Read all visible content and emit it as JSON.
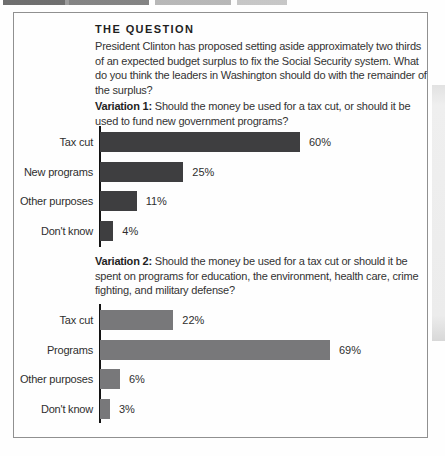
{
  "figure": {
    "question_header": "THE QUESTION",
    "question_text": "President Clinton has proposed setting aside approximately two thirds of an expected budget surplus to fix the Social Security system. What do you think the leaders in Washington should do with the remainder of the surplus?",
    "variation1": {
      "label": "Variation 1:",
      "text": "Should the money be used for a tax cut, or should it be used to fund new government programs?"
    },
    "variation2": {
      "label": "Variation 2:",
      "text": "Should the money be used for a tax cut or should it be spent on programs for education, the environment, health care, crime fighting, and military defense?"
    }
  },
  "colors": {
    "variation1_bar": "#3e3e40",
    "variation2_bar": "#78787a",
    "axis": "#141414",
    "box_border": "#909090"
  },
  "chart_data": [
    {
      "type": "bar",
      "orientation": "horizontal",
      "title": "Variation 1: Should the money be used for a tax cut, or should it be used to fund new government programs?",
      "categories": [
        "Tax cut",
        "New programs",
        "Other purposes",
        "Don't know"
      ],
      "values": [
        60,
        25,
        11,
        4
      ],
      "value_labels": [
        "60%",
        "25%",
        "11%",
        "4%"
      ],
      "bar_color": "#3e3e40",
      "xlim": [
        0,
        100
      ],
      "grid": false,
      "legend": false
    },
    {
      "type": "bar",
      "orientation": "horizontal",
      "title": "Variation 2: Should the money be used for a tax cut or should it be spent on programs for education, the environment, health care, crime fighting, and military defense?",
      "categories": [
        "Tax cut",
        "Programs",
        "Other purposes",
        "Don't know"
      ],
      "values": [
        22,
        69,
        6,
        3
      ],
      "value_labels": [
        "22%",
        "69%",
        "6%",
        "3%"
      ],
      "bar_color": "#78787a",
      "xlim": [
        0,
        100
      ],
      "grid": false,
      "legend": false
    }
  ]
}
